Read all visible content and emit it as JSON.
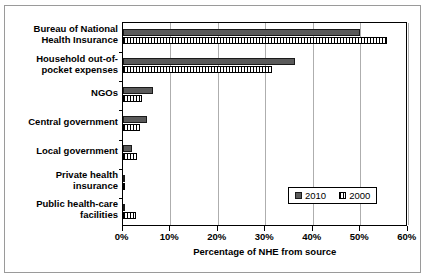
{
  "chart_data": {
    "type": "bar",
    "orientation": "horizontal",
    "title": "",
    "subtitle": "",
    "xlabel": "Percentage of NHE from source",
    "ylabel": "",
    "xlim": [
      0,
      60
    ],
    "xunit": "%",
    "xticks": [
      "0%",
      "10%",
      "20%",
      "30%",
      "40%",
      "50%",
      "60%"
    ],
    "xtick_values": [
      0,
      10,
      20,
      30,
      40,
      50,
      60
    ],
    "grid": true,
    "grid_axis": "x",
    "legend_position": "inside-lower-right",
    "categories": [
      "Bureau of National Health Insurance",
      "Household out-of-pocket expenses",
      "NGOs",
      "Central government",
      "Local government",
      "Private health insurance",
      "Public health-care facilities"
    ],
    "category_labels": [
      [
        "Bureau of National",
        "Health Insurance"
      ],
      [
        "Household out-of-",
        "pocket expenses"
      ],
      [
        "NGOs"
      ],
      [
        "Central government"
      ],
      [
        "Local government"
      ],
      [
        "Private health",
        "insurance"
      ],
      [
        "Public health-care",
        "facilities"
      ]
    ],
    "series": [
      {
        "name": "2010",
        "color": "#5a5a5a",
        "pattern": "solid",
        "values": [
          50.0,
          36.3,
          6.4,
          5.1,
          2.0,
          0.5,
          0.2
        ]
      },
      {
        "name": "2000",
        "color": "#ffffff",
        "pattern": "vertical-hatch",
        "values": [
          55.6,
          31.4,
          4.1,
          3.6,
          3.0,
          0.1,
          2.8
        ]
      }
    ]
  },
  "legend": {
    "items": [
      {
        "label": "2010"
      },
      {
        "label": "2000"
      }
    ]
  },
  "axis": {
    "x_title": "Percentage of NHE from source"
  }
}
